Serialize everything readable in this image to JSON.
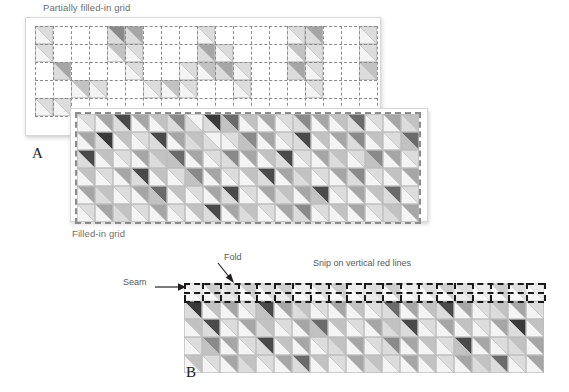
{
  "figure": {
    "panels": [
      {
        "letter": "A",
        "captions": {
          "top": "Partially filled-in grid",
          "bottom": "Filled-in grid"
        }
      },
      {
        "letter": "B",
        "annotations": {
          "seam": "Seam",
          "fold": "Fold",
          "snip": "Snip on vertical red lines"
        }
      }
    ]
  },
  "colors": {
    "page_background": "#ffffff",
    "card_background": "#ffffff",
    "card_border": "#d8d8d8",
    "caption_text": "#6d6e71",
    "letter_text": "#231f20",
    "grid_dash_light": "#8c8c8c",
    "grid_dash_dark": "#1a1a1a",
    "cell_outline": "#bcbcbc",
    "tone_white": "#f4f4f4",
    "tone_light": "#dcdcdc",
    "tone_mid_light": "#c2c2c2",
    "tone_mid": "#a6a6a6",
    "tone_mid_dark": "#8a8a8a",
    "tone_dark": "#6b6b6b",
    "tone_darkest": "#4a4a4a",
    "tone_black": "#3a3a3a"
  },
  "palette_keys": [
    "w",
    "l",
    "ml",
    "m",
    "md",
    "d",
    "dd",
    "k"
  ],
  "partial_grid": {
    "cols": 19,
    "rows": 5,
    "cell": 18,
    "description": "half-square-triangle grid, sparsely filled",
    "cells": [
      [
        "l/w",
        "",
        "",
        "",
        "md/l",
        "m/l",
        "",
        "",
        "",
        "l/w",
        "",
        "",
        "",
        "",
        "l/w",
        "m/l",
        "",
        "",
        "l/w"
      ],
      [
        "l/w",
        "",
        "",
        "",
        "ml/w",
        "l/w",
        "",
        "",
        "",
        "m/l",
        "l/w",
        "",
        "",
        "",
        "ml/w",
        "l/w",
        "",
        "",
        "l/w"
      ],
      [
        "",
        "m/l",
        "",
        "",
        "",
        "l/w",
        "",
        "",
        "l/w",
        "ml/w",
        "m/l",
        "l/w",
        "",
        "",
        "m/l",
        "l/w",
        "",
        "",
        "ml/l"
      ],
      [
        "",
        "",
        "ml/w",
        "l/w",
        "",
        "",
        "l/w",
        "ml/w",
        "l/w",
        "",
        "",
        "l/w",
        "",
        "",
        "",
        "l/w",
        "",
        "",
        ""
      ],
      [
        "l/w",
        "l/w",
        "",
        "",
        "",
        "",
        "",
        "",
        "",
        "",
        "",
        "",
        "",
        "",
        "",
        "",
        "",
        "",
        ""
      ]
    ]
  },
  "filled_grid": {
    "cols": 19,
    "rows": 6,
    "cell": 18,
    "description": "fully filled half-square-triangle grid",
    "cells": [
      [
        "l/w",
        "m/w",
        "dd/l",
        "m/w",
        "ml/w",
        "md/l",
        "w/l",
        "k/l",
        "d/ml",
        "ml/w",
        "m/w",
        "l/w",
        "md/l",
        "m/w",
        "ml/w",
        "d/l",
        "l/w",
        "m/w",
        "ml/l"
      ],
      [
        "m/w",
        "k/l",
        "ml/w",
        "l/w",
        "dd/l",
        "m/w",
        "ml/l",
        "w/l",
        "l/w",
        "md/ml",
        "m/w",
        "l/w",
        "dd/l",
        "ml/w",
        "m/w",
        "md/l",
        "ml/w",
        "l/w",
        "d/ml"
      ],
      [
        "dd/l",
        "ml/w",
        "l/w",
        "m/w",
        "ml/l",
        "d/ml",
        "m/w",
        "l/w",
        "md/l",
        "m/w",
        "ml/w",
        "dd/l",
        "l/w",
        "m/w",
        "ml/l",
        "l/w",
        "md/ml",
        "m/w",
        "l/w"
      ],
      [
        "ml/w",
        "l/w",
        "m/w",
        "dd/l",
        "ml/w",
        "l/w",
        "md/ml",
        "m/w",
        "l/w",
        "ml/w",
        "dd/l",
        "m/w",
        "ml/l",
        "l/w",
        "m/w",
        "md/l",
        "l/w",
        "ml/w",
        "m/w"
      ],
      [
        "m/w",
        "ml/l",
        "l/w",
        "m/w",
        "d/ml",
        "ml/w",
        "l/w",
        "m/w",
        "dd/l",
        "l/w",
        "m/w",
        "ml/l",
        "m/w",
        "dd/ml",
        "l/w",
        "m/w",
        "ml/w",
        "d/l",
        "l/w"
      ],
      [
        "l/w",
        "m/w",
        "ml/l",
        "l/w",
        "m/w",
        "l/w",
        "ml/w",
        "dd/l",
        "m/w",
        "ml/l",
        "l/w",
        "m/w",
        "md/l",
        "l/w",
        "ml/w",
        "m/w",
        "l/w",
        "ml/l",
        "m/w"
      ]
    ]
  },
  "strip_grid": {
    "cols": 20,
    "rows": 5,
    "cell": 18,
    "seam_row_index": 0,
    "description": "sewn strip with seam allowance row at top, fold and snip marks",
    "cells": [
      [
        "l/w",
        "m/w",
        "ml/l",
        "m/w",
        "ml/w",
        "m/l",
        "l/w",
        "ml/w",
        "m/w",
        "l/w",
        "ml/l",
        "m/w",
        "l/w",
        "ml/w",
        "m/w",
        "ml/l",
        "l/w",
        "m/w",
        "ml/w",
        "l/w"
      ],
      [
        "k/l",
        "ml/w",
        "m/w",
        "l/w",
        "dd/ml",
        "m/w",
        "ml/l",
        "l/w",
        "m/w",
        "ml/w",
        "l/w",
        "d/l",
        "m/w",
        "ml/w",
        "dd/l",
        "m/w",
        "l/w",
        "ml/l",
        "m/w",
        "l/w"
      ],
      [
        "ml/w",
        "dd/l",
        "l/w",
        "m/w",
        "ml/l",
        "l/w",
        "m/w",
        "d/ml",
        "ml/w",
        "l/w",
        "m/w",
        "ml/l",
        "dd/l",
        "l/w",
        "m/w",
        "ml/w",
        "l/w",
        "m/w",
        "k/l",
        "ml/w"
      ],
      [
        "l/w",
        "md/ml",
        "m/w",
        "l/w",
        "dd/l",
        "ml/w",
        "m/w",
        "l/w",
        "ml/l",
        "m/w",
        "l/w",
        "md/l",
        "m/w",
        "ml/w",
        "l/w",
        "dd/ml",
        "m/w",
        "l/w",
        "ml/l",
        "m/w"
      ],
      [
        "ml/w",
        "l/w",
        "m/w",
        "ml/l",
        "l/w",
        "m/w",
        "d/l",
        "ml/w",
        "l/w",
        "m/w",
        "ml/l",
        "l/w",
        "m/w",
        "ml/w",
        "l/w",
        "m/w",
        "ml/l",
        "d/l",
        "l/w",
        "m/w"
      ]
    ]
  }
}
